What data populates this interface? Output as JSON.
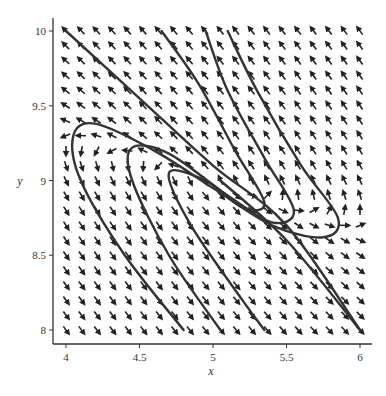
{
  "chart_data": {
    "type": "direction_field",
    "title": "",
    "xlabel": "x",
    "ylabel": "y",
    "xlim": [
      3.95,
      6.05
    ],
    "ylim": [
      7.9,
      10.1
    ],
    "x_ticks": [
      4,
      4.5,
      5,
      5.5,
      6
    ],
    "x_tick_labels": [
      "4",
      "4.5",
      "5",
      "5.5",
      "6"
    ],
    "y_ticks": [
      8,
      8.5,
      9,
      9.5,
      10
    ],
    "y_tick_labels": [
      "8",
      "8.5",
      "9",
      "9.5",
      "10"
    ],
    "grid": false,
    "legend": null,
    "equilibrium": {
      "x": 5.0,
      "y": 9.0
    },
    "field_grid": {
      "cols": 20,
      "rows": 21
    },
    "field_description": "Arrows point up-left in upper region, down-right in lower region, down on left near y=9.3, up on right near y=8.8",
    "trajectories": [
      {
        "name": "line-top-left",
        "points": [
          [
            4.0,
            10.0
          ],
          [
            4.5,
            9.55
          ],
          [
            5.0,
            9.1
          ],
          [
            5.5,
            8.7
          ],
          [
            6.0,
            8.0
          ]
        ]
      },
      {
        "name": "loop-outer",
        "points": [
          [
            5.1,
            10.0
          ],
          [
            5.3,
            9.6
          ],
          [
            5.6,
            9.1
          ],
          [
            5.85,
            8.75
          ],
          [
            5.75,
            8.62
          ],
          [
            5.4,
            8.7
          ],
          [
            5.0,
            8.95
          ],
          [
            4.6,
            9.2
          ],
          [
            4.2,
            9.38
          ],
          [
            4.05,
            9.3
          ],
          [
            4.1,
            9.0
          ],
          [
            4.4,
            8.5
          ],
          [
            4.8,
            8.0
          ]
        ]
      },
      {
        "name": "loop-mid",
        "points": [
          [
            4.95,
            10.0
          ],
          [
            5.1,
            9.6
          ],
          [
            5.35,
            9.15
          ],
          [
            5.55,
            8.8
          ],
          [
            5.4,
            8.72
          ],
          [
            5.1,
            8.9
          ],
          [
            4.7,
            9.18
          ],
          [
            4.45,
            9.22
          ],
          [
            4.45,
            9.0
          ],
          [
            4.7,
            8.5
          ],
          [
            5.05,
            8.0
          ]
        ]
      },
      {
        "name": "loop-inner",
        "points": [
          [
            4.65,
            10.0
          ],
          [
            4.9,
            9.65
          ],
          [
            5.15,
            9.2
          ],
          [
            5.35,
            8.85
          ],
          [
            5.2,
            8.82
          ],
          [
            4.95,
            9.0
          ],
          [
            4.7,
            9.05
          ],
          [
            4.85,
            8.7
          ],
          [
            5.2,
            8.2
          ],
          [
            5.35,
            8.0
          ]
        ]
      },
      {
        "name": "line-bottom-right",
        "points": [
          [
            5.05,
            9.0
          ],
          [
            5.5,
            8.6
          ],
          [
            6.0,
            8.0
          ]
        ]
      }
    ]
  }
}
